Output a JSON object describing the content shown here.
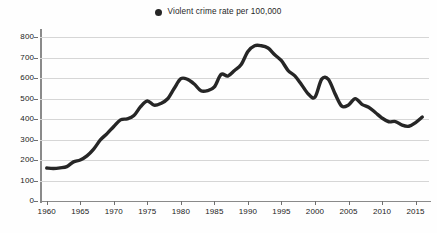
{
  "legend": {
    "marker_icon": "filled-circle-icon",
    "label": "Violent crime rate per 100,000",
    "marker_color": "#262626",
    "position": "top-center"
  },
  "colors": {
    "line": "#262626",
    "gridline": "#d6d6d6",
    "axis": "#8a8a8a",
    "text": "#222222",
    "background": "#fefefe"
  },
  "chart_data": {
    "type": "line",
    "title": "",
    "subtitle": "",
    "xlabel": "",
    "ylabel": "",
    "xlim": [
      1959,
      2017
    ],
    "ylim": [
      0,
      830
    ],
    "grid": true,
    "legend_position": "top-center",
    "y_ticks": [
      0,
      100,
      200,
      300,
      400,
      500,
      600,
      700,
      800
    ],
    "y_tick_labels": [
      "0",
      "100",
      "200",
      "300",
      "400",
      "500",
      "600",
      "700",
      "800"
    ],
    "x_ticks": [
      1960,
      1965,
      1970,
      1975,
      1980,
      1985,
      1990,
      1995,
      2000,
      2005,
      2010,
      2015
    ],
    "x_tick_labels": [
      "1960",
      "1965",
      "1970",
      "1975",
      "1980",
      "1985",
      "1990",
      "1995",
      "2000",
      "2005",
      "2010",
      "2015"
    ],
    "series": [
      {
        "name": "Violent crime rate per 100,000",
        "color": "#262626",
        "x": [
          1960,
          1961,
          1962,
          1963,
          1964,
          1965,
          1966,
          1967,
          1968,
          1969,
          1970,
          1971,
          1972,
          1973,
          1974,
          1975,
          1976,
          1977,
          1978,
          1979,
          1980,
          1981,
          1982,
          1983,
          1984,
          1985,
          1986,
          1987,
          1988,
          1989,
          1990,
          1991,
          1992,
          1993,
          1994,
          1995,
          1996,
          1997,
          1998,
          1999,
          2000,
          2001,
          2002,
          2003,
          2004,
          2005,
          2006,
          2007,
          2008,
          2009,
          2010,
          2011,
          2012,
          2013,
          2014,
          2015,
          2016
        ],
        "values": [
          161,
          159,
          162,
          168,
          191,
          200,
          220,
          253,
          298,
          329,
          364,
          396,
          401,
          417,
          461,
          488,
          468,
          476,
          498,
          549,
          597,
          594,
          571,
          538,
          539,
          557,
          618,
          610,
          637,
          666,
          730,
          758,
          758,
          747,
          714,
          685,
          637,
          611,
          568,
          523,
          507,
          595,
          594,
          523,
          463,
          469,
          500,
          472,
          458,
          432,
          405,
          387,
          388,
          370,
          365,
          383,
          410
        ]
      }
    ]
  }
}
